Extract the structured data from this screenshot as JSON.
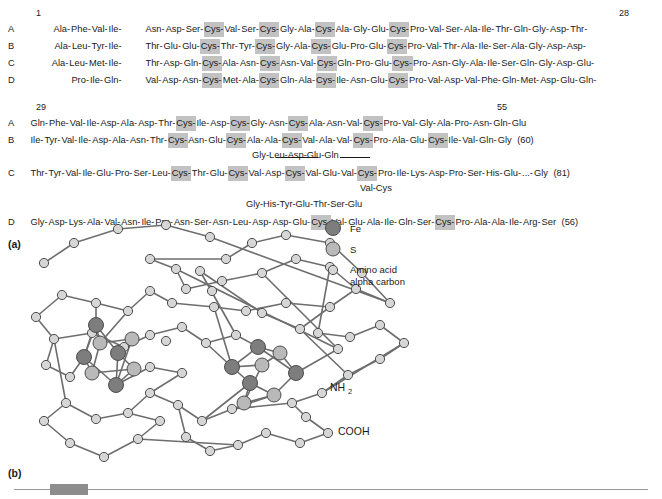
{
  "panels": {
    "a_label": "(a)",
    "b_label": "(b)"
  },
  "alignment": {
    "block1": {
      "start_number": "1",
      "end_number": "28",
      "rows": [
        {
          "id": "A",
          "seg1": [
            "Ala",
            "Phe",
            "Val",
            "Ile"
          ],
          "seg2": [
            "Asn",
            "Asp",
            "Ser",
            "Cys",
            "Val",
            "Ser",
            "Cys",
            "Gly",
            "Ala",
            "Cys",
            "Ala",
            "Gly",
            "Glu",
            "Cys",
            "Pro",
            "Val",
            "Ser",
            "Ala",
            "Ile",
            "Thr",
            "Gln",
            "Gly",
            "Asp",
            "Thr"
          ],
          "highlight": [
            "Cys"
          ]
        },
        {
          "id": "B",
          "seg1": [
            "Ala",
            "Leu",
            "Tyr",
            "Ile"
          ],
          "seg2": [
            "Thr",
            "Glu",
            "Glu",
            "Cys",
            "Thr",
            "Tyr",
            "Cys",
            "Gly",
            "Ala",
            "Cys",
            "Glu",
            "Pro",
            "Glu",
            "Cys",
            "Pro",
            "Val",
            "Thr",
            "Ala",
            "Ile",
            "Ser",
            "Ala",
            "Gly",
            "Asp",
            "Asp"
          ],
          "highlight": [
            "Cys"
          ]
        },
        {
          "id": "C",
          "seg1": [
            "Ala",
            "Leu",
            "Met",
            "Ile"
          ],
          "seg2": [
            "Thr",
            "Asp",
            "Gln",
            "Cys",
            "Ala",
            "Asn",
            "Cys",
            "Asn",
            "Val",
            "Cys",
            "Gln",
            "Pro",
            "Glu",
            "Cys",
            "Pro",
            "Asn",
            "Gly",
            "Ala",
            "Ile",
            "Ser",
            "Gln",
            "Gly",
            "Asp",
            "Glu"
          ],
          "highlight": [
            "Cys"
          ]
        },
        {
          "id": "D",
          "seg1": [
            "Pro",
            "Ile",
            "Gln"
          ],
          "seg2": [
            "Val",
            "Asp",
            "Asn",
            "Cys",
            "Met",
            "Ala",
            "Cys",
            "Gln",
            "Ala",
            "Cys",
            "Ile",
            "Asn",
            "Glu",
            "Cys",
            "Pro",
            "Val",
            "Asp",
            "Val",
            "Phe",
            "Gln",
            "Met",
            "Asp",
            "Glu",
            "Gln"
          ],
          "highlight": [
            "Cys"
          ]
        }
      ]
    },
    "block2": {
      "start_number": "29",
      "end_number": "55",
      "rows": [
        {
          "id": "A",
          "residues": [
            "Gln",
            "Phe",
            "Val",
            "Ile",
            "Asp",
            "Ala",
            "Asp",
            "Thr",
            "Cys",
            "Ile",
            "Asp",
            "Cys",
            "Gly",
            "Asn",
            "Cys",
            "Ala",
            "Asn",
            "Val",
            "Cys",
            "Pro",
            "Val",
            "Gly",
            "Ala",
            "Pro",
            "Asn",
            "Gln",
            "Glu"
          ],
          "count": ""
        },
        {
          "id": "B",
          "residues": [
            "Ile",
            "Tyr",
            "Val",
            "Ile",
            "Asp",
            "Ala",
            "Asn",
            "Thr",
            "Cys",
            "Asn",
            "Glu",
            "Cys",
            "Ala",
            "Ala",
            "Cys",
            "Val",
            "Ala",
            "Val",
            "Cys",
            "Pro",
            "Ala",
            "Glu",
            "Cys",
            "Ile",
            "Val",
            "Gln",
            "Gly"
          ],
          "count": "(60)"
        },
        {
          "id": "C",
          "residues": [
            "Thr",
            "Tyr",
            "Val",
            "Ile",
            "Glu",
            "Pro",
            "Ser",
            "Leu",
            "Cys",
            "Thr",
            "Glu",
            "Cys",
            "Val",
            "Asp",
            "Cys",
            "Val",
            "Glu",
            "Val",
            "Cys",
            "Pro",
            "Ile",
            "Lys",
            "Asp",
            "Pro",
            "Ser",
            "His",
            "Glu",
            "...",
            "Gly"
          ],
          "count": "(81)"
        },
        {
          "id": "D",
          "residues": [
            "Gly",
            "Asp",
            "Lys",
            "Ala",
            "Val",
            "Asn",
            "Ile",
            "Pro",
            "Asn",
            "Ser",
            "Asn",
            "Leu",
            "Asp",
            "Asp",
            "Glu",
            "Cys",
            "Val",
            "Glu",
            "Ala",
            "Ile",
            "Gln",
            "Ser",
            "Cys",
            "Pro",
            "Ala",
            "Ala",
            "Ile",
            "Arg",
            "Ser"
          ],
          "count": "(56)"
        }
      ],
      "insertions": [
        {
          "owner": "B",
          "residues": [
            "Gly",
            "Leu",
            "Asp",
            "Glu",
            "Gln"
          ]
        },
        {
          "owner": "C",
          "residues": [
            "Val",
            "Cys"
          ]
        },
        {
          "owner": "C2",
          "residues": [
            "Gly",
            "His",
            "Tyr",
            "Glu",
            "Thr",
            "Ser",
            "Glu"
          ]
        }
      ]
    }
  },
  "structure": {
    "legend": [
      {
        "symbol_name": "fe-atom-swatch",
        "label": "Fe",
        "color": "#8a8a8a"
      },
      {
        "symbol_name": "s-atom-swatch",
        "label": "S",
        "color": "#b5b5b5"
      },
      {
        "symbol_name": "alpha-carbon-swatch",
        "label": "Amino acid",
        "label2": "alpha carbon",
        "color": "#d2d2d2"
      }
    ],
    "terminus_labels": {
      "n_terminus": "NH",
      "n_terminus_sub": "2",
      "c_terminus": "COOH"
    },
    "colors": {
      "fe": "#7d7d7d",
      "sulfur": "#b0b0b0",
      "carbon": "#d0d0d0",
      "bond": "#6e6e6e",
      "outline": "#4d4d4d"
    }
  }
}
